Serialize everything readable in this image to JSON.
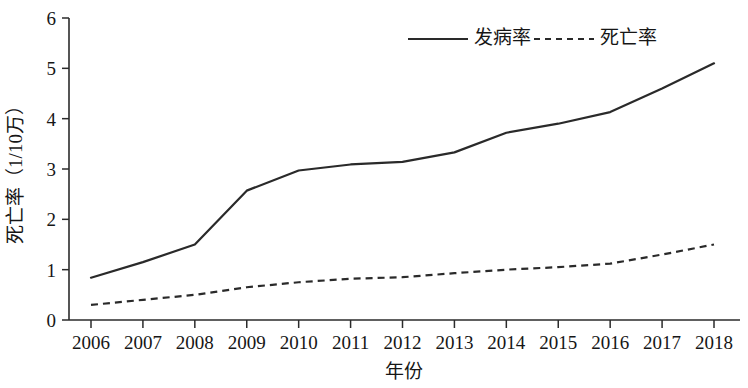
{
  "chart_data": {
    "type": "line",
    "title": "",
    "xlabel": "年份",
    "ylabel": "死亡率（1/10万）",
    "x": [
      2006,
      2007,
      2008,
      2009,
      2010,
      2011,
      2012,
      2013,
      2014,
      2015,
      2016,
      2017,
      2018
    ],
    "xticklabels": [
      "2006",
      "2007",
      "2008",
      "2009",
      "2010",
      "2011",
      "2012",
      "2013",
      "2014",
      "2015",
      "2016",
      "2017",
      "2018"
    ],
    "yticklabels": [
      "0",
      "1",
      "2",
      "3",
      "4",
      "5",
      "6"
    ],
    "yticks": [
      0,
      1,
      2,
      3,
      4,
      5,
      6
    ],
    "ylim": [
      0,
      6
    ],
    "xlim": [
      2006,
      2018
    ],
    "grid": false,
    "legend_position": "top-center",
    "series": [
      {
        "name": "发病率",
        "style": "solid",
        "color": "#2a2a2a",
        "values": [
          0.84,
          1.15,
          1.5,
          2.57,
          2.97,
          3.09,
          3.14,
          3.33,
          3.72,
          3.9,
          4.13,
          4.6,
          5.1
        ]
      },
      {
        "name": "死亡率",
        "style": "dashed",
        "color": "#2a2a2a",
        "values": [
          0.3,
          0.4,
          0.5,
          0.65,
          0.75,
          0.82,
          0.85,
          0.93,
          1.0,
          1.05,
          1.12,
          1.3,
          1.5
        ]
      }
    ]
  },
  "legend": {
    "items": [
      {
        "label": "发病率",
        "style": "solid"
      },
      {
        "label": "死亡率",
        "style": "dashed"
      }
    ]
  },
  "axes": {
    "x_title": "年份",
    "y_title": "死亡率（1/10万）"
  }
}
